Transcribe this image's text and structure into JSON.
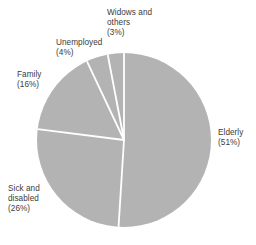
{
  "chart_data": {
    "type": "pie",
    "title": "",
    "subtitle": "",
    "xlabel": "",
    "ylabel": "",
    "legend_position": "none",
    "grid": false,
    "units": "percent",
    "start_angle_deg": 0,
    "direction": "clockwise",
    "slice_fill_color": "#b3b3b3",
    "slice_separator_color": "#ffffff",
    "label_color": "#3b3b3b",
    "background_color": "#ffffff",
    "categories": [
      "Elderly",
      "Sick and disabled",
      "Family",
      "Unemployed",
      "Widows and others"
    ],
    "values": [
      51,
      26,
      16,
      4,
      3
    ],
    "slices": [
      {
        "name": "Elderly",
        "value": 51,
        "label_line1": "Elderly",
        "label_line2": "(51%)",
        "label_text": "Elderly\n(51%)",
        "percent_text": "(51%)"
      },
      {
        "name": "Sick and disabled",
        "value": 26,
        "label_line1": "Sick and",
        "label_line2": "disabled",
        "label_line3": "(26%)",
        "label_text": "Sick and\ndisabled\n(26%)",
        "percent_text": "(26%)"
      },
      {
        "name": "Family",
        "value": 16,
        "label_line1": "Family",
        "label_line2": "(16%)",
        "label_text": "Family\n(16%)",
        "percent_text": "(16%)"
      },
      {
        "name": "Unemployed",
        "value": 4,
        "label_line1": "Unemployed",
        "label_line2": "(4%)",
        "label_text": "Unemployed\n(4%)",
        "percent_text": "(4%)"
      },
      {
        "name": "Widows and others",
        "value": 3,
        "label_line1": "Widows and",
        "label_line2": "others",
        "label_line3": "(3%)",
        "label_text": "Widows and\nothers\n(3%)",
        "percent_text": "(3%)"
      }
    ],
    "geometry": {
      "center_x": 124,
      "center_y": 140,
      "radius": 87
    }
  }
}
